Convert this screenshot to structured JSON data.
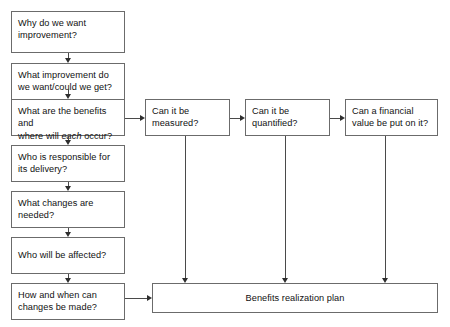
{
  "diagram": {
    "type": "flowchart",
    "background_color": "#ffffff",
    "box_border_color": "#6b6b6b",
    "connector_color": "#4a4a4a",
    "text_color": "#111111",
    "left_column": [
      {
        "id": "why-improvement",
        "line1": "Why do we want",
        "line2": "improvement?"
      },
      {
        "id": "what-improvement",
        "line1": "What improvement do",
        "line2": "we want/could we get?"
      },
      {
        "id": "benefits-where",
        "line1": "What are the benefits and",
        "line2_a": "where will ",
        "line2_italic": "each",
        "line2_b": " occur?"
      },
      {
        "id": "who-responsible",
        "line1": "Who is responsible for",
        "line2": "its delivery?"
      },
      {
        "id": "what-changes",
        "line1": "What changes are",
        "line2": "needed?"
      },
      {
        "id": "who-affected",
        "line1": "Who will be affected?",
        "line2": ""
      },
      {
        "id": "how-when-changes",
        "line1": "How and when can",
        "line2": "changes be made?"
      }
    ],
    "right_row": [
      {
        "id": "can-measured",
        "line1": "Can it be",
        "line2": "measured?"
      },
      {
        "id": "can-quantified",
        "line1": "Can it be",
        "line2": "quantified?"
      },
      {
        "id": "financial-value",
        "line1": "Can a financial",
        "line2": "value be put on it?"
      }
    ],
    "outcome": {
      "id": "benefits-plan",
      "label": "Benefits realization plan"
    }
  }
}
